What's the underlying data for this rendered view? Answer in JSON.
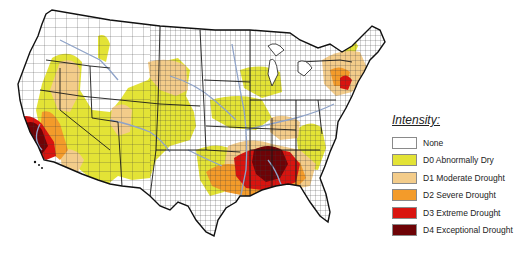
{
  "map": {
    "title": "U.S. Drought Monitor",
    "region": "Contiguous United States",
    "colors": {
      "state_border": "#1a1a1a",
      "county_border": "#3a3a3a",
      "river": "#8fa3c8",
      "background": "#ffffff"
    }
  },
  "legend": {
    "title": "Intensity:",
    "items": [
      {
        "code": "None",
        "label": "None",
        "color": "#ffffff"
      },
      {
        "code": "D0",
        "label": "D0 Abnormally Dry",
        "color": "#e3e336"
      },
      {
        "code": "D1",
        "label": "D1 Moderate Drought",
        "color": "#f3cc8a"
      },
      {
        "code": "D2",
        "label": "D2 Severe Drought",
        "color": "#f39b2a"
      },
      {
        "code": "D3",
        "label": "D3 Extreme Drought",
        "color": "#d9140f"
      },
      {
        "code": "D4",
        "label": "D4 Exceptional Drought",
        "color": "#6e0306"
      }
    ]
  }
}
